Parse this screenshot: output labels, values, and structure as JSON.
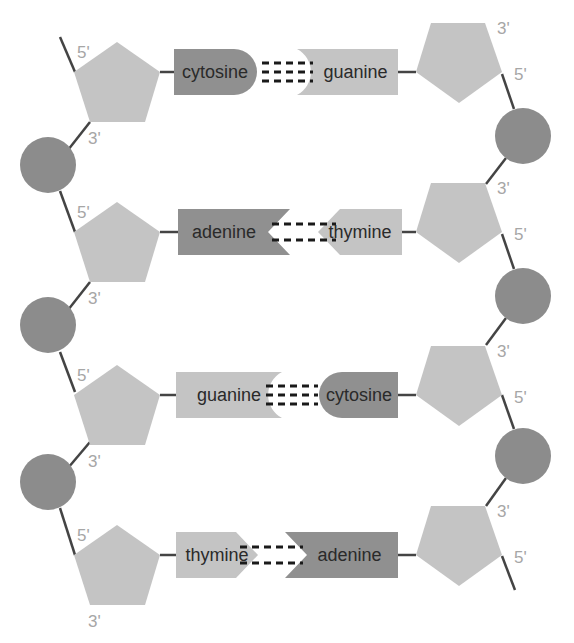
{
  "diagram": {
    "colors": {
      "sugar": "#c4c4c4",
      "phosphate": "#8c8c8c",
      "purine_dark": "#909090",
      "base_light": "#c4c4c4",
      "backbone": "#444444",
      "hydrogen_bond": "#1a1a1a",
      "prime_label": "#a6a6a6",
      "text": "#2a2a2a"
    },
    "pairs": [
      {
        "left_base": "cytosine",
        "right_base": "guanine",
        "hydrogen_bonds": 3,
        "left_prime_top": "5'",
        "left_prime_bottom": "3'",
        "right_prime_top": "3'",
        "right_prime_bottom": "5'"
      },
      {
        "left_base": "adenine",
        "right_base": "thymine",
        "hydrogen_bonds": 2,
        "left_prime_top": "5'",
        "left_prime_bottom": "3'",
        "right_prime_top": "3'",
        "right_prime_bottom": "5'"
      },
      {
        "left_base": "guanine",
        "right_base": "cytosine",
        "hydrogen_bonds": 3,
        "left_prime_top": "5'",
        "left_prime_bottom": "3'",
        "right_prime_top": "3'",
        "right_prime_bottom": "5'"
      },
      {
        "left_base": "thymine",
        "right_base": "adenine",
        "hydrogen_bonds": 2,
        "left_prime_top": "5'",
        "left_prime_bottom": "3'",
        "right_prime_top": "3'",
        "right_prime_bottom": "5'"
      }
    ]
  }
}
